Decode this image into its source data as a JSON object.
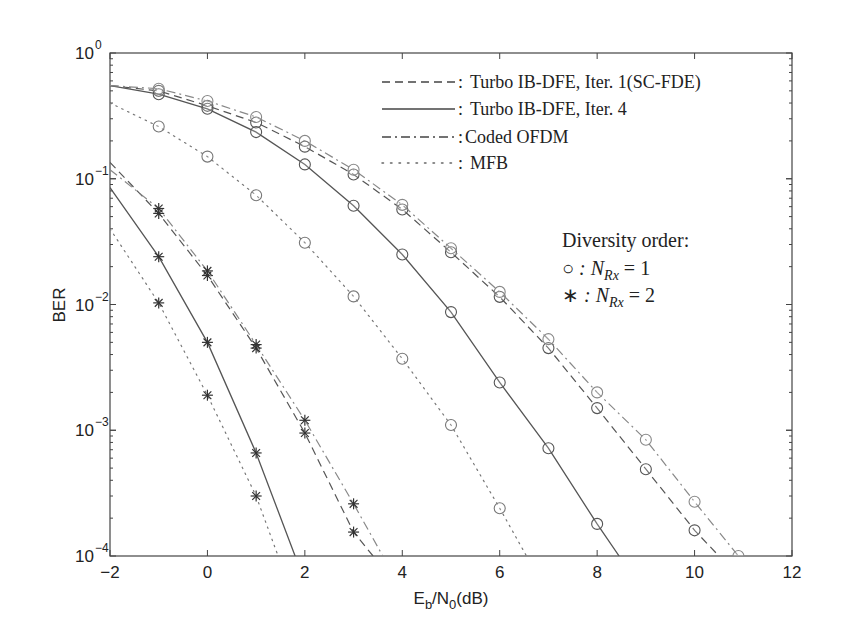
{
  "chart_data": {
    "type": "line",
    "title": "",
    "xlabel": "E_b/N_0(dB)",
    "xlabel_parts": {
      "main": "E",
      "sub1": "b",
      "mid": "/N",
      "sub2": "0",
      "tail": "(dB)"
    },
    "ylabel": "BER",
    "xlim": [
      -2,
      12
    ],
    "ylim": [
      0.0001,
      1
    ],
    "yscale": "log",
    "grid": false,
    "x_ticks": [
      -2,
      0,
      2,
      4,
      6,
      8,
      10,
      12
    ],
    "x_tick_labels": [
      "−2",
      "0",
      "2",
      "4",
      "6",
      "8",
      "10",
      "12"
    ],
    "y_ticks": [
      0,
      -1,
      -2,
      -3,
      -4
    ],
    "y_tick_labels": [
      "10^0",
      "10^-1",
      "10^-2",
      "10^-3",
      "10^-4"
    ],
    "legend": {
      "position": "upper right",
      "entries": [
        {
          "style": "dashed",
          "label": "Turbo IB-DFE, Iter. 1(SC-FDE)"
        },
        {
          "style": "solid",
          "label": "Turbo IB-DFE, Iter. 4"
        },
        {
          "style": "dashdot",
          "label": "Coded OFDM"
        },
        {
          "style": "dotted",
          "label": "MFB"
        }
      ]
    },
    "annotation": {
      "title": "Diversity order:",
      "rows": [
        {
          "marker": "○",
          "text": " : N",
          "sub": "Rx",
          "tail": " = 1"
        },
        {
          "marker": "∗",
          "text": " : N",
          "sub": "Rx",
          "tail": " = 2"
        }
      ]
    },
    "series": [
      {
        "name": "Turbo IB-DFE, Iter. 1(SC-FDE), NRx=1",
        "style": "dashed",
        "marker": "circle",
        "color": "#555555",
        "x": [
          -2,
          -1,
          0,
          1,
          2,
          3,
          4,
          5,
          6,
          7,
          8,
          9,
          10,
          10.5
        ],
        "y": [
          0.55,
          0.5,
          0.38,
          0.28,
          0.18,
          0.108,
          0.057,
          0.026,
          0.0115,
          0.0045,
          0.0015,
          0.00049,
          0.00016,
          0.0001
        ],
        "markers_at": [
          -1,
          0,
          1,
          2,
          3,
          4,
          5,
          6,
          7,
          8,
          9,
          10
        ]
      },
      {
        "name": "Turbo IB-DFE, Iter. 4, NRx=1",
        "style": "solid",
        "marker": "circle",
        "color": "#555555",
        "x": [
          -2,
          -1,
          0,
          1,
          2,
          3,
          4,
          5,
          6,
          7,
          8,
          8.45
        ],
        "y": [
          0.55,
          0.47,
          0.36,
          0.235,
          0.13,
          0.061,
          0.025,
          0.0087,
          0.0024,
          0.00072,
          0.00018,
          0.0001
        ],
        "markers_at": [
          -1,
          0,
          1,
          2,
          3,
          4,
          5,
          6,
          7,
          8
        ]
      },
      {
        "name": "Coded OFDM, NRx=1",
        "style": "dashdot",
        "marker": "circle",
        "color": "#888888",
        "x": [
          -2,
          -1,
          0,
          1,
          2,
          3,
          4,
          5,
          6,
          7,
          8,
          9,
          10,
          10.9
        ],
        "y": [
          0.55,
          0.52,
          0.415,
          0.31,
          0.2,
          0.118,
          0.062,
          0.028,
          0.0126,
          0.0053,
          0.002,
          0.00084,
          0.00027,
          0.0001
        ],
        "markers_at": [
          -1,
          0,
          1,
          2,
          3,
          4,
          5,
          6,
          7,
          8,
          9,
          10,
          10.9
        ]
      },
      {
        "name": "MFB, NRx=1",
        "style": "dotted",
        "marker": "circle",
        "color": "#777777",
        "x": [
          -2,
          -1,
          0,
          1,
          2,
          3,
          4,
          5,
          6,
          6.55
        ],
        "y": [
          0.4,
          0.26,
          0.15,
          0.074,
          0.031,
          0.0116,
          0.0037,
          0.0011,
          0.00024,
          0.0001
        ],
        "markers_at": [
          -1,
          0,
          1,
          2,
          3,
          4,
          5,
          6
        ]
      },
      {
        "name": "Turbo IB-DFE, Iter. 1(SC-FDE), NRx=2",
        "style": "dashed",
        "marker": "star",
        "color": "#555555",
        "x": [
          -2,
          -1,
          0,
          1,
          2,
          3,
          3.4
        ],
        "y": [
          0.135,
          0.053,
          0.017,
          0.0045,
          0.00095,
          0.000155,
          0.0001
        ],
        "markers_at": [
          -1,
          0,
          1,
          2,
          3
        ]
      },
      {
        "name": "Turbo IB-DFE, Iter. 4, NRx=2",
        "style": "solid",
        "marker": "star",
        "color": "#555555",
        "x": [
          -2,
          -1,
          0,
          1,
          1.8
        ],
        "y": [
          0.085,
          0.024,
          0.005,
          0.00066,
          0.0001
        ],
        "markers_at": [
          -1,
          0,
          1
        ]
      },
      {
        "name": "Coded OFDM, NRx=2",
        "style": "dashdot",
        "marker": "star",
        "color": "#888888",
        "x": [
          -2,
          -1,
          0,
          1,
          2,
          3,
          3.6
        ],
        "y": [
          0.118,
          0.058,
          0.0185,
          0.0048,
          0.0012,
          0.00026,
          0.0001
        ],
        "markers_at": [
          -1,
          0,
          1,
          2,
          3
        ]
      },
      {
        "name": "MFB, NRx=2",
        "style": "dotted",
        "marker": "star",
        "color": "#777777",
        "x": [
          -2,
          -1,
          0,
          1,
          1.45
        ],
        "y": [
          0.04,
          0.0103,
          0.0019,
          0.0003,
          0.0001
        ],
        "markers_at": [
          -1,
          0,
          1
        ]
      }
    ]
  }
}
